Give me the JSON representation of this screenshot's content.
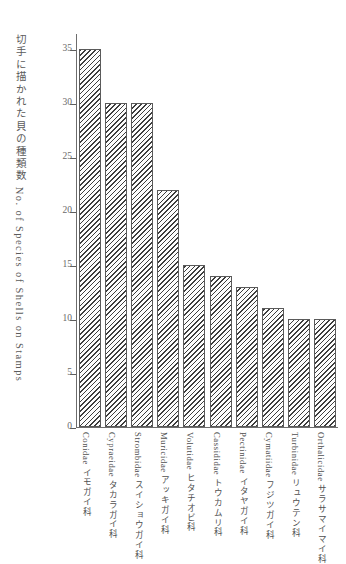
{
  "chart_data": {
    "type": "bar",
    "title": "",
    "subtitle": "",
    "xlabel": "",
    "ylabel": "切手に描かれた貝の種類数 No. of Species of Shells on Stamps",
    "ylim": [
      0,
      36.5
    ],
    "ytick_values": [
      0,
      5,
      10,
      15,
      20,
      25,
      30,
      35
    ],
    "ytick_labels": [
      "0",
      "5",
      "10",
      "15",
      "20",
      "25",
      "30",
      "35"
    ],
    "grid": false,
    "legend": null,
    "bar_style": "diagonal-hatch",
    "categories": [
      "Conidae イモガイ科",
      "Cypraeidae タカラガイ科",
      "Strombidae スイショウガイ科",
      "Muricidae アッキガイ科",
      "Volutidae ヒタチオビ科",
      "Cassididae トウカムリ科",
      "Pectinidae イタヤガイ科",
      "Cymatiidae フジツガイ科",
      "Turbinidae リュウテン科",
      "Orthalicidae サラサマイマイ科"
    ],
    "categories_latin": [
      "Conidae",
      "Cypraeidae",
      "Strombidae",
      "Muricidae",
      "Volutidae",
      "Cassididae",
      "Pectinidae",
      "Cymatiidae",
      "Turbinidae",
      "Orthalicidae"
    ],
    "categories_japanese": [
      "イモガイ科",
      "タカラガイ科",
      "スイショウガイ科",
      "アッキガイ科",
      "ヒタチオビ科",
      "トウカムリ科",
      "イタヤガイ科",
      "フジツガイ科",
      "リュウテン科",
      "サラサマイマイ科"
    ],
    "values": [
      35,
      30,
      30,
      22,
      15,
      14,
      13,
      11,
      10,
      10
    ]
  },
  "colors": {
    "axis": "#6d6d6d",
    "bar_outline": "#5a5a5a",
    "hatch": "#3d3d3d",
    "text": "#4f4f4f",
    "background": "#ffffff"
  }
}
